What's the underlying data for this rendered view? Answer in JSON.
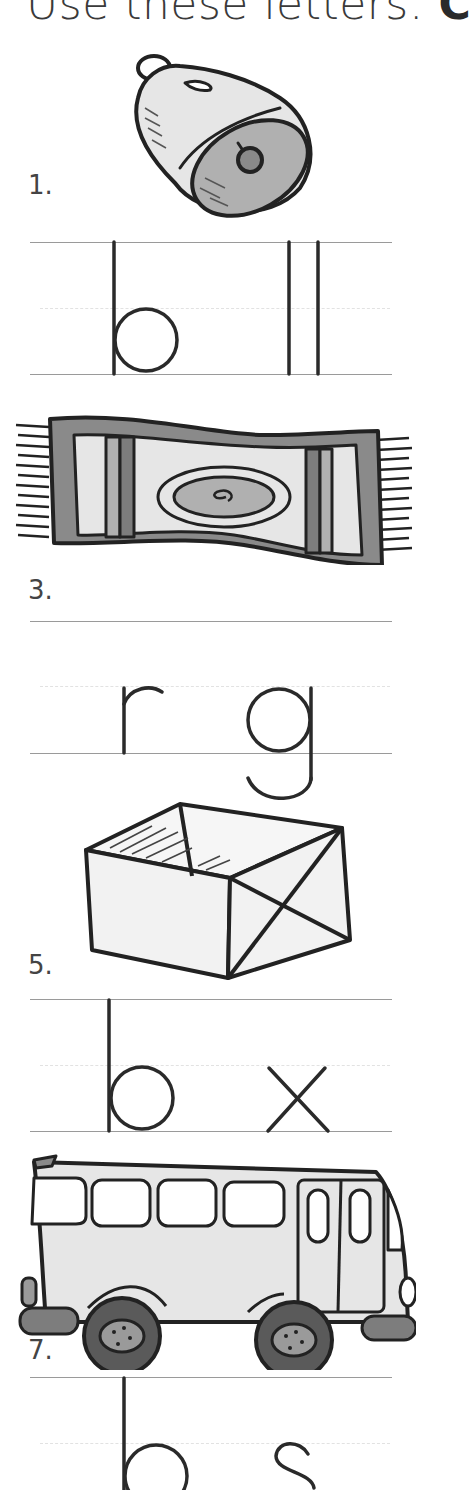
{
  "title": {
    "text": "Use these letters:",
    "bold_text": "C"
  },
  "items": [
    {
      "number": "1.",
      "picture": "bell-picture",
      "letters_left": "b",
      "letters_right": "ll",
      "missing": "e"
    },
    {
      "number": "3.",
      "picture": "rug-picture",
      "letters_left": "r",
      "letters_right": "g",
      "missing": "u"
    },
    {
      "number": "5.",
      "picture": "box-picture",
      "letters_left": "b",
      "letters_right": "x",
      "missing": "o"
    },
    {
      "number": "7.",
      "picture": "bus-picture",
      "letters_left": "b",
      "letters_right": "s",
      "missing": "u"
    }
  ],
  "colors": {
    "ink": "#222222",
    "rule": "#9a9a9a",
    "fill_light": "#e4e4e4",
    "fill_mid": "#b0b0b0",
    "fill_dark": "#7d7d7d"
  }
}
